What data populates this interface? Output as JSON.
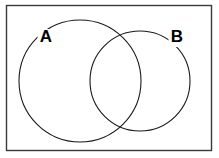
{
  "figure": {
    "kind": "venn-diagram",
    "background_color": "#ffffff",
    "frame": {
      "name": "outer-border",
      "stroke_color": "#3a3a3a",
      "x": 6.5,
      "y": 5.5,
      "width": 205,
      "height": 145
    },
    "stroke_color": "#1a1a1a",
    "label_color": "#000000",
    "sets": [
      {
        "label": "A",
        "circle": {
          "cx": 80,
          "cy": 81,
          "r": 61
        },
        "label_pos": {
          "x": 46,
          "y": 38
        }
      },
      {
        "label": "B",
        "circle": {
          "cx": 140,
          "cy": 81,
          "r": 50
        },
        "label_pos": {
          "x": 177,
          "y": 38
        }
      }
    ]
  },
  "chart_data": {
    "type": "diagram",
    "diagram_type": "venn",
    "title": "",
    "set_count": 2,
    "sets": [
      {
        "name": "A",
        "label": "A"
      },
      {
        "name": "B",
        "label": "B"
      }
    ],
    "regions": [
      "A only",
      "A and B",
      "B only"
    ],
    "region_labels": [],
    "shaded_regions": [],
    "legend": []
  }
}
